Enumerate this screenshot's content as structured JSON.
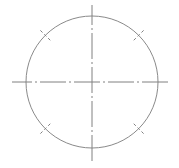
{
  "canvas": {
    "width": 179,
    "height": 168,
    "background_color": "#ffffff",
    "title": "Bolt Circle Centerline Drawing"
  },
  "style": {
    "line_color": "#808080",
    "circle_color": "#8a8a8a",
    "line_width": 1,
    "circle_width": 1,
    "centerline_dash_pattern": "26 3 2 3",
    "tick_dash_pattern": "3 2.5"
  },
  "chart_data": {
    "type": "scatter",
    "xlabel": "",
    "ylabel": "",
    "elements": [
      {
        "name": "pitch-circle",
        "kind": "circle",
        "cx": 92,
        "cy": 82,
        "r": 66,
        "stroke": "#8a8a8a",
        "fill": "none"
      },
      {
        "name": "horizontal-centerline",
        "kind": "line",
        "x1": 12,
        "y1": 82,
        "x2": 170,
        "y2": 82,
        "stroke": "#808080",
        "dashed": true
      },
      {
        "name": "vertical-centerline",
        "kind": "line",
        "x1": 92,
        "y1": 5,
        "x2": 92,
        "y2": 163,
        "stroke": "#808080",
        "dashed": true
      }
    ],
    "radial_tick_angles_deg": [
      45,
      135,
      225,
      315
    ],
    "radial_tick_inner_radius": 59,
    "radial_tick_outer_radius": 73,
    "center_point": {
      "x": 92,
      "y": 82
    },
    "circle_diameter_px": 132,
    "grid": false,
    "legend": null
  },
  "labels": {
    "center_mark": "",
    "diameter_note": "",
    "annotation": ""
  }
}
